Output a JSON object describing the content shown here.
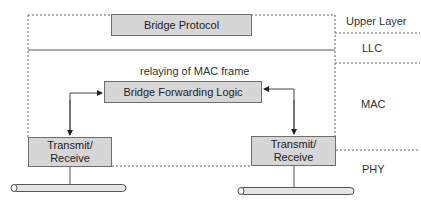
{
  "diagram": {
    "boxes": {
      "bridge_protocol": "Bridge Protocol",
      "bridge_forwarding_logic": "Bridge Forwarding Logic",
      "transmit_receive_left": {
        "line1": "Transmit/",
        "line2": "Receive"
      },
      "transmit_receive_right": {
        "line1": "Transmit/",
        "line2": "Receive"
      }
    },
    "annotations": {
      "relaying": "relaying of MAC frame"
    },
    "layers": [
      {
        "name": "Upper Layer"
      },
      {
        "name": "LLC"
      },
      {
        "name": "MAC"
      },
      {
        "name": "PHY"
      }
    ],
    "colors": {
      "box_fill": "#d6d6d6",
      "box_border": "#6e6e6e",
      "line": "#555555",
      "cable_fill": "#e4e4e4"
    }
  }
}
